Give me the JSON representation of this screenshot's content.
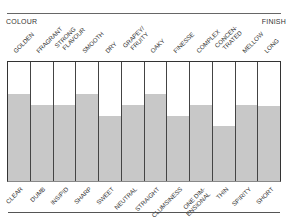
{
  "chart_data": {
    "type": "bar",
    "title": "",
    "header_left": "COLOUR",
    "header_right": "FINISH",
    "categories_top": [
      "GOLDEN",
      "FRAGRANT",
      "STRONG FLAVOUR",
      "SMOOTH",
      "DRY",
      "GRAPEY/ FRUITY",
      "OAKY",
      "FINESSE",
      "COMPLEX",
      "CONCEN- TRATED",
      "MELLOW",
      "LONG"
    ],
    "categories_bottom": [
      "CLEAR",
      "DUMB",
      "INSIPID",
      "SHARP",
      "SWEET",
      "NEUTRAL",
      "STRAIGHT",
      "CLUMSINESS",
      "ONE DIM- ENSIONAL",
      "THIN",
      "SPIRITY",
      "SHORT"
    ],
    "values": [
      73,
      64,
      64,
      73,
      55,
      64,
      73,
      55,
      64,
      46,
      64,
      63
    ],
    "ylim": [
      0,
      100
    ],
    "xlabel": "",
    "ylabel": "",
    "grid": false,
    "legend": "none",
    "fill_color": "#c8c8c8"
  },
  "labels_top": [
    {
      "l1": "GOLDEN",
      "l2": ""
    },
    {
      "l1": "FRAGRANT",
      "l2": ""
    },
    {
      "l1": "STRONG",
      "l2": "FLAVOUR"
    },
    {
      "l1": "SMOOTH",
      "l2": ""
    },
    {
      "l1": "DRY",
      "l2": ""
    },
    {
      "l1": "GRAPEY/",
      "l2": "FRUITY"
    },
    {
      "l1": "OAKY",
      "l2": ""
    },
    {
      "l1": "FINESSE",
      "l2": ""
    },
    {
      "l1": "COMPLEX",
      "l2": ""
    },
    {
      "l1": "CONCEN-",
      "l2": "TRATED"
    },
    {
      "l1": "MELLOW",
      "l2": ""
    },
    {
      "l1": "LONG",
      "l2": ""
    }
  ],
  "labels_bottom": [
    {
      "l1": "CLEAR",
      "l2": ""
    },
    {
      "l1": "DUMB",
      "l2": ""
    },
    {
      "l1": "INSIPID",
      "l2": ""
    },
    {
      "l1": "SHARP",
      "l2": ""
    },
    {
      "l1": "SWEET",
      "l2": ""
    },
    {
      "l1": "NEUTRAL",
      "l2": ""
    },
    {
      "l1": "STRAIGHT",
      "l2": ""
    },
    {
      "l1": "CLUMSINESS",
      "l2": ""
    },
    {
      "l1": "ONE DIM-",
      "l2": "ENSIONAL"
    },
    {
      "l1": "THIN",
      "l2": ""
    },
    {
      "l1": "SPIRITY",
      "l2": ""
    },
    {
      "l1": "SHORT",
      "l2": ""
    }
  ]
}
